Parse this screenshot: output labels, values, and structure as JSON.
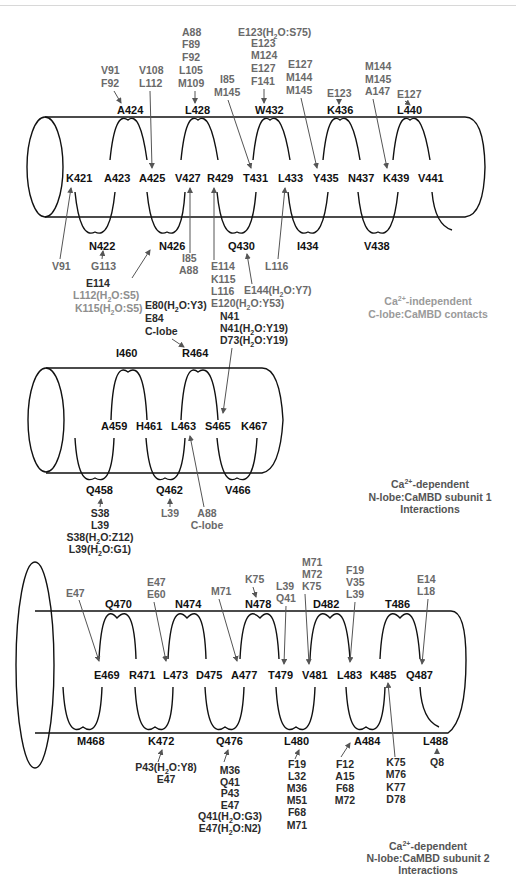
{
  "panels": [
    {
      "id": "helix1",
      "caption": {
        "line1_prefix": "Ca",
        "line1_sup": "2+",
        "line1_suffix": "-independent",
        "line2": "C-lobe:CaMBD contacts"
      },
      "residues_middle": [
        "K421",
        "A423",
        "A425",
        "V427",
        "R429",
        "T431",
        "L433",
        "Y435",
        "N437",
        "K439",
        "V441"
      ],
      "residues_top": [
        "A424",
        "L428",
        "W432",
        "K436",
        "L440"
      ],
      "residues_bottom": [
        "N422",
        "N426",
        "Q430",
        "I434",
        "V438"
      ],
      "contacts": [
        {
          "target": "A424",
          "labels": [
            "V91",
            "F92"
          ]
        },
        {
          "target": "A425",
          "labels": [
            "V108",
            "L112"
          ]
        },
        {
          "target": "L428",
          "labels": [
            "A88",
            "F89",
            "F92",
            "L105",
            "M109"
          ]
        },
        {
          "target": "T431",
          "labels": [
            "I85",
            "M145"
          ]
        },
        {
          "target": "W432",
          "labels": [
            "E123(H2O:S75)",
            "E123",
            "M124",
            "E127",
            "F141"
          ]
        },
        {
          "target": "Y435",
          "labels": [
            "E127",
            "M144",
            "M145"
          ]
        },
        {
          "target": "K436",
          "labels": [
            "E123"
          ]
        },
        {
          "target": "K439",
          "labels": [
            "M144",
            "M145",
            "A147"
          ]
        },
        {
          "target": "L440",
          "labels": [
            "E127"
          ]
        },
        {
          "target": "K421",
          "labels": [
            "V91"
          ]
        },
        {
          "target": "N422",
          "labels": [
            "G113"
          ]
        },
        {
          "target": "N426",
          "labels": [
            "E114",
            "L112(H2O:S5)",
            "K115(H2O:S5)"
          ]
        },
        {
          "target": "V427",
          "labels": [
            "I85",
            "A88"
          ]
        },
        {
          "target": "R429",
          "labels": [
            "E114",
            "K115",
            "L116",
            "E120(H2O:Y53)"
          ]
        },
        {
          "target": "Q430",
          "labels": [
            "E144(H2O:Y7)"
          ]
        },
        {
          "target": "L433",
          "labels": [
            "L116"
          ]
        }
      ]
    },
    {
      "id": "helix2",
      "caption": {
        "line1_prefix": "Ca",
        "line1_sup": "2+",
        "line1_suffix": "-dependent",
        "line2": "N-lobe:CaMBD subunit 1",
        "line3": "Interactions"
      },
      "residues_middle": [
        "A459",
        "H461",
        "L463",
        "S465",
        "K467"
      ],
      "residues_top": [
        "I460",
        "R464"
      ],
      "residues_bottom": [
        "Q458",
        "Q462",
        "V466"
      ],
      "contacts": [
        {
          "target": "R464",
          "labels": [
            "E80(H2O:Y3)",
            "E84",
            "C-lobe"
          ]
        },
        {
          "target": "S465",
          "labels": [
            "N41",
            "N41(H2O:Y19)",
            "D73(H2O:Y19)"
          ]
        },
        {
          "target": "Q458",
          "labels": [
            "S38",
            "L39",
            "S38(H2O:Z12)",
            "L39(H2O:G1)"
          ]
        },
        {
          "target": "Q462",
          "labels": [
            "L39"
          ]
        },
        {
          "target": "L463",
          "labels": [
            "A88",
            "C-lobe"
          ]
        }
      ]
    },
    {
      "id": "helix3",
      "caption": {
        "line1_prefix": "Ca",
        "line1_sup": "2+",
        "line1_suffix": "-dependent",
        "line2": "N-lobe:CaMBD subunit 2",
        "line3": "Interactions"
      },
      "residues_middle": [
        "E469",
        "R471",
        "L473",
        "D475",
        "A477",
        "T479",
        "V481",
        "L483",
        "K485",
        "Q487"
      ],
      "residues_top": [
        "Q470",
        "N474",
        "N478",
        "D482",
        "T486"
      ],
      "residues_bottom": [
        "M468",
        "K472",
        "Q476",
        "L480",
        "A484",
        "L488"
      ],
      "contacts": [
        {
          "target": "E469",
          "labels": [
            "E47"
          ]
        },
        {
          "target": "L473",
          "labels": [
            "E47",
            "E60"
          ]
        },
        {
          "target": "A477",
          "labels": [
            "M71"
          ]
        },
        {
          "target": "N478",
          "labels": [
            "K75"
          ]
        },
        {
          "target": "T479",
          "labels": [
            "L39",
            "Q41"
          ]
        },
        {
          "target": "V481",
          "labels": [
            "M71",
            "M72",
            "K75"
          ]
        },
        {
          "target": "L483",
          "labels": [
            "F19",
            "V35",
            "L39"
          ]
        },
        {
          "target": "Q487",
          "labels": [
            "E14",
            "L18"
          ]
        },
        {
          "target": "K472",
          "labels": [
            "P43(H2O:Y8)",
            "E47"
          ]
        },
        {
          "target": "Q476",
          "labels": [
            "M36",
            "Q41",
            "P43",
            "E47",
            "Q41(H2O:G3)",
            "E47(H2O:N2)"
          ]
        },
        {
          "target": "L480",
          "labels": [
            "F19",
            "L32",
            "M36",
            "M51",
            "F68",
            "M71"
          ]
        },
        {
          "target": "A484",
          "labels": [
            "F12",
            "A15",
            "F68",
            "M72"
          ]
        },
        {
          "target": "K485",
          "labels": [
            "K75",
            "M76",
            "K77",
            "D78"
          ]
        },
        {
          "target": "L488",
          "labels": [
            "Q8"
          ]
        }
      ]
    }
  ],
  "t": {
    "h1": {
      "m": [
        "K421",
        "A423",
        "A425",
        "V427",
        "R429",
        "T431",
        "L433",
        "Y435",
        "N437",
        "K439",
        "V441"
      ],
      "top": [
        "A424",
        "L428",
        "W432",
        "K436",
        "L440"
      ],
      "bot": [
        "N422",
        "N426",
        "Q430",
        "I434",
        "V438"
      ],
      "c_a424": [
        "V91",
        "F92"
      ],
      "c_a425": [
        "V108",
        "L112"
      ],
      "c_l428": [
        "A88",
        "F89",
        "F92",
        "L105",
        "M109"
      ],
      "c_t431": [
        "I85",
        "M145"
      ],
      "c_w432": [
        "E123(H",
        "2",
        "O:S75)",
        "E123",
        "M124",
        "E127",
        "F141"
      ],
      "c_y435": [
        "E127",
        "M144",
        "M145"
      ],
      "c_k436": [
        "E123"
      ],
      "c_k439": [
        "M144",
        "M145",
        "A147"
      ],
      "c_l440": [
        "E127"
      ],
      "c_k421": [
        "V91"
      ],
      "c_n422": [
        "G113"
      ],
      "c_n426": [
        "E114",
        "L112(H",
        "2",
        "O:S5)",
        "K115(H",
        "2",
        "O:S5)"
      ],
      "c_v427": [
        "I85",
        "A88"
      ],
      "c_r429": [
        "E114",
        "K115",
        "L116",
        "E120(H",
        "2",
        "O:Y53)"
      ],
      "c_q430": [
        "E144(H",
        "2",
        "O:Y7)"
      ],
      "c_l433": [
        "L116"
      ],
      "cap1": [
        "Ca",
        "2+",
        "-independent",
        "C-lobe:CaMBD contacts"
      ]
    },
    "h2": {
      "m": [
        "A459",
        "H461",
        "L463",
        "S465",
        "K467"
      ],
      "top": [
        "I460",
        "R464"
      ],
      "bot": [
        "Q458",
        "Q462",
        "V466"
      ],
      "c_r464": [
        "E80(H",
        "2",
        "O:Y3)",
        "E84",
        "C-lobe"
      ],
      "c_s465": [
        "N41",
        "N41(H",
        "2",
        "O:Y19)",
        "D73(H",
        "2",
        "O:Y19)"
      ],
      "c_q458": [
        "S38",
        "L39",
        "S38(H",
        "2",
        "O:Z12)",
        "L39(H",
        "2",
        "O:G1)"
      ],
      "c_q462": [
        "L39"
      ],
      "c_l463": [
        "A88",
        "C-lobe"
      ],
      "cap": [
        "Ca",
        "2+",
        "-dependent",
        "N-lobe:CaMBD subunit 1",
        "Interactions"
      ]
    },
    "h3": {
      "m": [
        "E469",
        "R471",
        "L473",
        "D475",
        "A477",
        "T479",
        "V481",
        "L483",
        "K485",
        "Q487"
      ],
      "top": [
        "Q470",
        "N474",
        "N478",
        "D482",
        "T486"
      ],
      "bot": [
        "M468",
        "K472",
        "Q476",
        "L480",
        "A484",
        "L488"
      ],
      "c_e469": [
        "E47"
      ],
      "c_l473": [
        "E47",
        "E60"
      ],
      "c_a477": [
        "M71"
      ],
      "c_n478": [
        "K75"
      ],
      "c_t479": [
        "L39",
        "Q41"
      ],
      "c_v481": [
        "M71",
        "M72",
        "K75"
      ],
      "c_l483": [
        "F19",
        "V35",
        "L39"
      ],
      "c_q487": [
        "E14",
        "L18"
      ],
      "c_k472": [
        "P43(H",
        "2",
        "O:Y8)",
        "E47"
      ],
      "c_q476": [
        "M36",
        "Q41",
        "P43",
        "E47",
        "Q41(H",
        "2",
        "O:G3)",
        "E47(H",
        "2",
        "O:N2)"
      ],
      "c_l480": [
        "F19",
        "L32",
        "M36",
        "M51",
        "F68",
        "M71"
      ],
      "c_a484": [
        "F12",
        "A15",
        "F68",
        "M72"
      ],
      "c_k485": [
        "K75",
        "M76",
        "K77",
        "D78"
      ],
      "c_l488": [
        "Q8"
      ],
      "cap": [
        "Ca",
        "2+",
        "-dependent",
        "N-lobe:CaMBD subunit 2",
        "Interactions"
      ]
    }
  }
}
